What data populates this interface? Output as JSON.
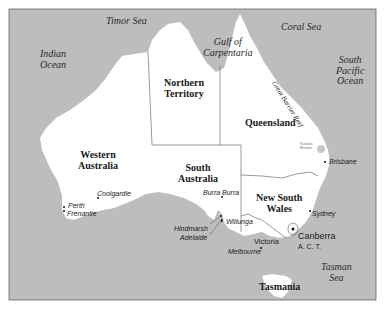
{
  "map": {
    "title": "Australia",
    "colors": {
      "sea": "#bdbdbd",
      "land": "#ffffff",
      "border": "#555555",
      "frame": "#666666"
    },
    "seas": {
      "timor_sea": "Timor Sea",
      "indian_ocean_1": "Indian",
      "indian_ocean_2": "Ocean",
      "gulf_1": "Gulf of",
      "gulf_2": "Carpentaria",
      "coral_sea": "Coral Sea",
      "south_pacific_1": "South",
      "south_pacific_2": "Pacific",
      "south_pacific_3": "Ocean",
      "great_barrier_reef": "Great Barrier Reef",
      "tasman_1": "Tasman",
      "tasman_2": "Sea"
    },
    "states": {
      "nt_1": "Northern",
      "nt_2": "Territory",
      "qld": "Queensland",
      "wa_1": "Western",
      "wa_2": "Australia",
      "sa_1": "South",
      "sa_2": "Australia",
      "nsw_1": "New South",
      "nsw_2": "Wales",
      "vic": "Victoria",
      "tas": "Tasmania",
      "act": "A. C. T."
    },
    "cities": {
      "perth": "Perth",
      "fremantle": "Frenantle",
      "coolgardie": "Coolgardie",
      "burra_burra": "Burra Burra",
      "hindmarsh": "Hindmarsh",
      "adelaide": "Adelaide",
      "willunga": "Willunga",
      "melbourne": "Melbourne",
      "sydney": "Sydney",
      "brisbane": "Brisbane",
      "canberra": "Canberra",
      "small_label_1": "Kumalie",
      "small_label_2": "Mission"
    }
  }
}
